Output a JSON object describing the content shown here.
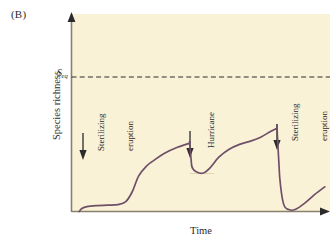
{
  "figure": {
    "panel_label": "(B)",
    "background_color": "#faf2d6",
    "curve_color": "#6d5068",
    "axis_color": "#8a8070",
    "text_color": "#2b2b2b"
  },
  "axes": {
    "ylabel": "Species richness",
    "xlabel": "Time",
    "threshold_label": "S",
    "threshold_sub": "eq"
  },
  "annotations": [
    {
      "name": "sterilizing-eruption-1",
      "line1": "Sterilizing",
      "line2": "eruption"
    },
    {
      "name": "hurricane",
      "line1": "Hurricane",
      "line2": ""
    },
    {
      "name": "sterilizing-eruption-2",
      "line1": "Sterilizing",
      "line2": "eruption"
    }
  ],
  "chart_data": {
    "type": "line",
    "xlabel": "Time",
    "ylabel": "Species richness",
    "xlim": [
      0,
      100
    ],
    "ylim": [
      0,
      100
    ],
    "grid": false,
    "legend_position": "none",
    "axis_tick_labels": {
      "y": [
        "S_eq"
      ],
      "x": []
    },
    "reference_lines": [
      {
        "name": "equilibrium-richness",
        "label": "S_eq",
        "orientation": "horizontal",
        "y": 70,
        "style": "dashed"
      }
    ],
    "event_markers": [
      {
        "label": "Sterilizing eruption",
        "x": 4.3,
        "arrow": "down"
      },
      {
        "label": "Hurricane",
        "x": 45.7,
        "arrow": "down"
      },
      {
        "label": "Sterilizing eruption",
        "x": 79.5,
        "arrow": "down"
      }
    ],
    "series": [
      {
        "name": "species-richness",
        "color": "#6d5068",
        "x": [
          3.0,
          4.0,
          6.0,
          10.0,
          14.0,
          18.0,
          21.0,
          23.5,
          26.0,
          29.0,
          32.0,
          36.0,
          41.0,
          45.5,
          45.7,
          46.5,
          48.5,
          51.0,
          53.5,
          57.0,
          61.0,
          65.0,
          69.0,
          73.0,
          77.0,
          79.3,
          79.5,
          80.5,
          82.0,
          84.0,
          86.5,
          90.0,
          94.0,
          98.0
        ],
        "y": [
          0.0,
          1.5,
          2.5,
          3.0,
          3.2,
          3.5,
          5.0,
          10.0,
          18.0,
          23.0,
          26.0,
          29.5,
          32.5,
          34.5,
          34.5,
          23.0,
          20.0,
          19.5,
          22.0,
          27.5,
          31.5,
          34.0,
          35.5,
          37.5,
          40.5,
          42.0,
          42.0,
          18.0,
          4.0,
          1.0,
          1.0,
          4.0,
          8.5,
          12.5
        ]
      }
    ]
  }
}
